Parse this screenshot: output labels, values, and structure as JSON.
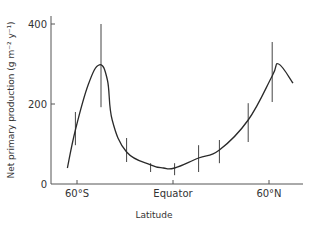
{
  "chart_data": {
    "type": "line",
    "title": "",
    "xlabel": "Latitude",
    "ylabel": "Net primary production (g m⁻² y⁻¹)",
    "ylim": [
      0,
      400
    ],
    "xlim": [
      -75,
      80
    ],
    "grid": false,
    "legend": null,
    "y_ticks": [
      {
        "value": 0,
        "label": "0"
      },
      {
        "value": 200,
        "label": "200"
      },
      {
        "value": 400,
        "label": "400"
      }
    ],
    "x_ticks": [
      {
        "value": -60,
        "label": "60°S"
      },
      {
        "value": 0,
        "label": "Equator"
      },
      {
        "value": 60,
        "label": "60°N"
      }
    ],
    "series": [
      {
        "name": "Net primary production",
        "x": [
          -66,
          -61,
          -53,
          -46,
          -41,
          -38,
          -29,
          -14,
          -6,
          1,
          16,
          29,
          47,
          62,
          66,
          75
        ],
        "values": [
          40,
          135,
          248,
          298,
          260,
          160,
          80,
          48,
          40,
          40,
          65,
          85,
          160,
          270,
          300,
          252
        ]
      }
    ],
    "error_bars": [
      {
        "x": -61,
        "low": 97,
        "high": 180
      },
      {
        "x": -45,
        "low": 192,
        "high": 400
      },
      {
        "x": -29,
        "low": 55,
        "high": 115
      },
      {
        "x": -14,
        "low": 30,
        "high": 52
      },
      {
        "x": 1,
        "low": 22,
        "high": 52
      },
      {
        "x": 16,
        "low": 30,
        "high": 97
      },
      {
        "x": 29,
        "low": 52,
        "high": 110
      },
      {
        "x": 47,
        "low": 105,
        "high": 202
      },
      {
        "x": 62,
        "low": 205,
        "high": 355
      }
    ]
  },
  "colors": {
    "line": "#2a2a2a",
    "axis": "#555555",
    "text": "#333333"
  }
}
